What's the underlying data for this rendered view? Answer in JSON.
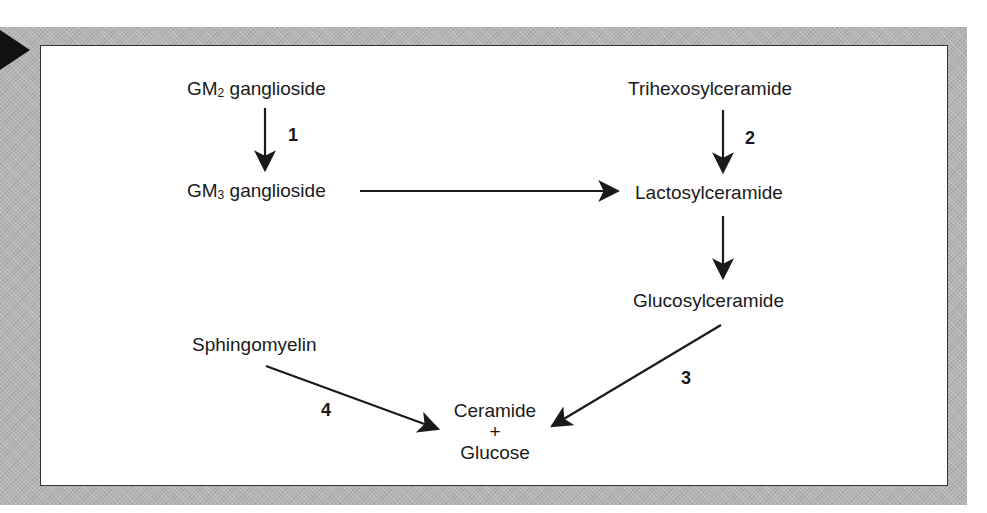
{
  "diagram": {
    "type": "metabolic-pathway",
    "nodes": {
      "gm2": {
        "prefix": "GM",
        "sub": "2",
        "suffix": " ganglioside"
      },
      "gm3": {
        "prefix": "GM",
        "sub": "3",
        "suffix": " ganglioside"
      },
      "trihexosylceramide": "Trihexosylceramide",
      "lactosylceramide": "Lactosylceramide",
      "glucosylceramide": "Glucosylceramide",
      "sphingomyelin": "Sphingomyelin",
      "ceramide": "Ceramide",
      "plus": "+",
      "glucose": "Glucose"
    },
    "steps": {
      "s1": "1",
      "s2": "2",
      "s3": "3",
      "s4": "4"
    },
    "edges": [
      {
        "from": "GM2 ganglioside",
        "to": "GM3 ganglioside",
        "label": "1"
      },
      {
        "from": "GM3 ganglioside",
        "to": "Lactosylceramide",
        "label": ""
      },
      {
        "from": "Trihexosylceramide",
        "to": "Lactosylceramide",
        "label": "2"
      },
      {
        "from": "Lactosylceramide",
        "to": "Glucosylceramide",
        "label": ""
      },
      {
        "from": "Glucosylceramide",
        "to": "Ceramide + Glucose",
        "label": "3"
      },
      {
        "from": "Sphingomyelin",
        "to": "Ceramide + Glucose",
        "label": "4"
      }
    ],
    "colors": {
      "frame": "#b4b4b4",
      "ink": "#1a1a1a",
      "panel": "#ffffff"
    }
  }
}
